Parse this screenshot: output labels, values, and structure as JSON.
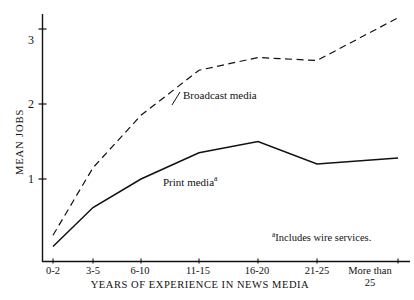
{
  "chart_data": {
    "type": "line",
    "title": "",
    "subtitle": "",
    "xlabel": "YEARS OF EXPERIENCE IN NEWS MEDIA",
    "ylabel": "MEAN JOBS",
    "categories": [
      "0-2",
      "3-5",
      "6-10",
      "11-15",
      "16-20",
      "21-25",
      "More than 25"
    ],
    "x_tick_labels": [
      "0-2",
      "3-5",
      "6-10",
      "11-15",
      "16-20",
      "21-25",
      "More than\n25"
    ],
    "y_tick_labels": [
      "1",
      "2",
      "3"
    ],
    "y_ticks": [
      1,
      2,
      3
    ],
    "ylim": [
      0.1,
      3.35
    ],
    "xlim": [
      0,
      6
    ],
    "grid": false,
    "legend": "inline-annotations",
    "series": [
      {
        "name": "Broadcast media",
        "style": "dashed",
        "color": "#111111",
        "values": [
          0.25,
          1.15,
          1.85,
          2.45,
          2.62,
          2.58,
          3.15
        ]
      },
      {
        "name": "Print media",
        "style": "solid",
        "color": "#111111",
        "values": [
          0.1,
          0.62,
          1.0,
          1.35,
          1.5,
          1.2,
          1.28
        ]
      }
    ],
    "annotations": [
      {
        "text": "Broadcast media",
        "superscript": "",
        "x_px": 183,
        "y_px": 96
      },
      {
        "text": "Print media",
        "superscript": "a",
        "x_px": 163,
        "y_px": 183
      }
    ],
    "footnote": {
      "marker": "a",
      "text": "Includes wire services."
    }
  },
  "axes": {
    "y_title": "MEAN JOBS",
    "x_title": "YEARS OF EXPERIENCE IN NEWS MEDIA"
  },
  "labels": {
    "broadcast": "Broadcast media",
    "print": "Print media",
    "print_sup": "a",
    "footnote_marker": "a",
    "footnote_text": "Includes wire services.",
    "x_more_than": "More than",
    "x_more_than_2": "25"
  }
}
